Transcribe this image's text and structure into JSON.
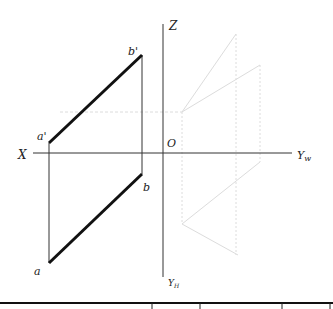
{
  "diagram": {
    "type": "orthographic-projection",
    "axes": {
      "x_label": "X",
      "z_label": "Z",
      "origin_label": "O",
      "yw_label": "Y",
      "yw_sub": "w",
      "yh_label": "Y",
      "yh_sub": "H"
    },
    "points": {
      "a_prime": "a'",
      "b_prime": "b'",
      "a": "a",
      "b": "b"
    },
    "colors": {
      "main_line": "#111111",
      "axis_line": "#333333",
      "construction_line": "#d8d8d8"
    }
  }
}
